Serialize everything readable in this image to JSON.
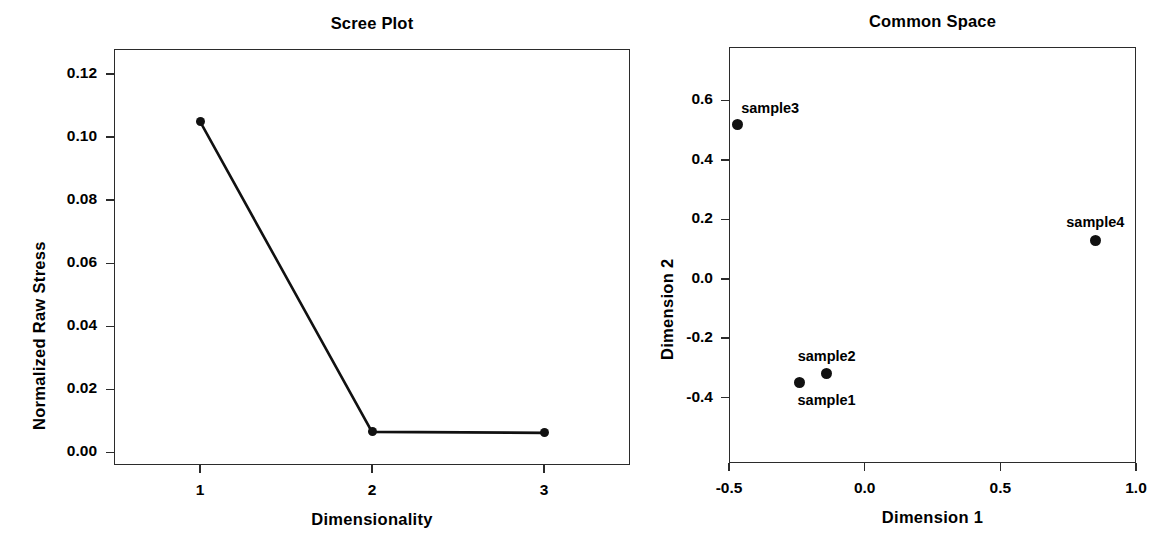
{
  "chart_data": [
    {
      "type": "line",
      "title": "Scree Plot",
      "xlabel": "Dimensionality",
      "ylabel": "Normalized Raw Stress",
      "x": [
        1,
        2,
        3
      ],
      "values": [
        0.105,
        0.0065,
        0.0062
      ],
      "xticks": [
        "1",
        "2",
        "3"
      ],
      "yticks": [
        "0.00",
        "0.02",
        "0.04",
        "0.06",
        "0.08",
        "0.10",
        "0.12"
      ],
      "ytickvalues": [
        0.0,
        0.02,
        0.04,
        0.06,
        0.08,
        0.1,
        0.12
      ],
      "xlim": [
        0.5,
        3.5
      ],
      "ylim": [
        -0.004,
        0.128
      ],
      "grid": false,
      "legend": "none",
      "marker": "filled-circle",
      "line_color": "#111111"
    },
    {
      "type": "scatter",
      "title": "Common Space",
      "xlabel": "Dimension 1",
      "ylabel": "Dimension 2",
      "points": [
        {
          "label": "sample1",
          "x": -0.24,
          "y": -0.35,
          "label_pos": "below-right"
        },
        {
          "label": "sample2",
          "x": -0.14,
          "y": -0.32,
          "label_pos": "above"
        },
        {
          "label": "sample3",
          "x": -0.47,
          "y": 0.52,
          "label_pos": "above-right"
        },
        {
          "label": "sample4",
          "x": 0.85,
          "y": 0.13,
          "label_pos": "above"
        }
      ],
      "xticks": [
        "-0.5",
        "0.0",
        "0.5",
        "1.0"
      ],
      "xtickvalues": [
        -0.5,
        0.0,
        0.5,
        1.0
      ],
      "yticks": [
        "-0.4",
        "-0.2",
        "0.0",
        "0.2",
        "0.4",
        "0.6"
      ],
      "ytickvalues": [
        -0.4,
        -0.2,
        0.0,
        0.2,
        0.4,
        0.6
      ],
      "xlim": [
        -0.5,
        1.0
      ],
      "ylim": [
        -0.62,
        0.78
      ],
      "grid": false,
      "legend": "none",
      "marker": "filled-circle",
      "point_color": "#111111"
    }
  ],
  "figure": {
    "background": "#ffffff",
    "axis_color": "#2b2b2b"
  }
}
